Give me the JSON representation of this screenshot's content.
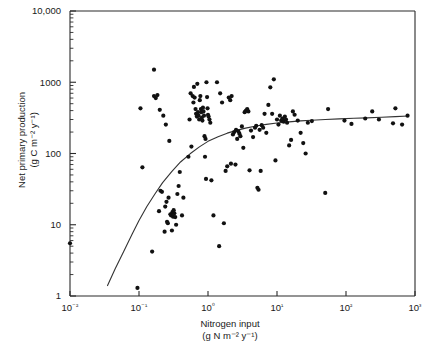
{
  "chart_data": {
    "type": "scatter",
    "title": "",
    "xlabel": "Nitrogen input",
    "xlabel_units": "(g N m⁻² y⁻¹)",
    "ylabel": "Net primary production",
    "ylabel_units": "(g C m⁻² y⁻¹)",
    "xscale": "log",
    "yscale": "log",
    "xlim": [
      0.01,
      1000
    ],
    "ylim": [
      1,
      10000
    ],
    "grid": false,
    "legend": null,
    "x_tick_labels": [
      "10⁻²",
      "10⁻¹",
      "10⁰",
      "10¹",
      "10²",
      "10³"
    ],
    "x_tick_values": [
      0.01,
      0.1,
      1,
      10,
      100,
      1000
    ],
    "y_tick_labels": [
      "1",
      "10",
      "100",
      "1000",
      "10,000"
    ],
    "y_tick_values": [
      1,
      10,
      100,
      1000,
      10000
    ],
    "marker": {
      "shape": "circle",
      "color": "#111111",
      "size_px": 4.2
    },
    "fit_curve": {
      "name": "saturating fit",
      "color": "#333333",
      "width_px": 1.1,
      "points": [
        [
          0.035,
          1.4
        ],
        [
          0.045,
          2.4
        ],
        [
          0.06,
          4.2
        ],
        [
          0.08,
          7.5
        ],
        [
          0.1,
          11.5
        ],
        [
          0.13,
          18
        ],
        [
          0.17,
          27
        ],
        [
          0.22,
          39
        ],
        [
          0.3,
          56
        ],
        [
          0.4,
          76
        ],
        [
          0.55,
          99
        ],
        [
          0.75,
          124
        ],
        [
          1.0,
          148
        ],
        [
          1.4,
          172
        ],
        [
          1.9,
          193
        ],
        [
          2.6,
          211
        ],
        [
          3.5,
          227
        ],
        [
          5.0,
          243
        ],
        [
          7.0,
          256
        ],
        [
          10,
          268
        ],
        [
          15,
          278
        ],
        [
          22,
          287
        ],
        [
          32,
          293
        ],
        [
          50,
          300
        ],
        [
          80,
          306
        ],
        [
          130,
          312
        ],
        [
          200,
          316
        ],
        [
          330,
          322
        ],
        [
          520,
          329
        ],
        [
          800,
          336
        ]
      ]
    },
    "points": [
      [
        0.01,
        5.5
      ],
      [
        0.095,
        1.3
      ],
      [
        0.105,
        430
      ],
      [
        0.112,
        64
      ],
      [
        0.155,
        4.2
      ],
      [
        0.165,
        640
      ],
      [
        0.165,
        1500
      ],
      [
        0.175,
        600
      ],
      [
        0.185,
        660
      ],
      [
        0.195,
        15.5
      ],
      [
        0.2,
        410
      ],
      [
        0.205,
        30
      ],
      [
        0.215,
        29
      ],
      [
        0.225,
        340
      ],
      [
        0.235,
        8.0
      ],
      [
        0.24,
        18
      ],
      [
        0.245,
        255
      ],
      [
        0.25,
        21
      ],
      [
        0.255,
        11
      ],
      [
        0.262,
        10.5
      ],
      [
        0.268,
        24
      ],
      [
        0.275,
        150
      ],
      [
        0.285,
        14
      ],
      [
        0.292,
        13.5
      ],
      [
        0.3,
        8.3
      ],
      [
        0.305,
        15
      ],
      [
        0.312,
        13
      ],
      [
        0.318,
        16
      ],
      [
        0.325,
        14.5
      ],
      [
        0.335,
        12.8
      ],
      [
        0.345,
        10
      ],
      [
        0.36,
        27
      ],
      [
        0.375,
        35
      ],
      [
        0.39,
        55
      ],
      [
        0.42,
        13.5
      ],
      [
        0.44,
        24
      ],
      [
        0.52,
        90
      ],
      [
        0.54,
        300
      ],
      [
        0.56,
        700
      ],
      [
        0.575,
        125
      ],
      [
        0.6,
        640
      ],
      [
        0.615,
        520
      ],
      [
        0.625,
        860
      ],
      [
        0.64,
        610
      ],
      [
        0.66,
        420
      ],
      [
        0.672,
        360
      ],
      [
        0.69,
        330
      ],
      [
        0.7,
        950
      ],
      [
        0.715,
        380
      ],
      [
        0.73,
        340
      ],
      [
        0.745,
        300
      ],
      [
        0.76,
        560
      ],
      [
        0.775,
        640
      ],
      [
        0.79,
        420
      ],
      [
        0.8,
        380
      ],
      [
        0.815,
        320
      ],
      [
        0.83,
        290
      ],
      [
        0.845,
        440
      ],
      [
        0.86,
        390
      ],
      [
        0.875,
        340
      ],
      [
        0.89,
        175
      ],
      [
        0.905,
        90
      ],
      [
        0.92,
        160
      ],
      [
        0.935,
        44
      ],
      [
        0.95,
        1000
      ],
      [
        0.97,
        620
      ],
      [
        0.985,
        430
      ],
      [
        1.0,
        350
      ],
      [
        1.02,
        330
      ],
      [
        1.05,
        300
      ],
      [
        1.08,
        270
      ],
      [
        1.12,
        42
      ],
      [
        1.2,
        13.5
      ],
      [
        1.35,
        1000
      ],
      [
        1.45,
        5.0
      ],
      [
        1.5,
        700
      ],
      [
        1.6,
        520
      ],
      [
        1.7,
        10.5
      ],
      [
        1.8,
        57
      ],
      [
        1.9,
        66
      ],
      [
        2.0,
        610
      ],
      [
        2.1,
        560
      ],
      [
        2.15,
        72
      ],
      [
        2.2,
        640
      ],
      [
        2.3,
        185
      ],
      [
        2.4,
        200
      ],
      [
        2.5,
        70
      ],
      [
        2.55,
        215
      ],
      [
        2.65,
        160
      ],
      [
        2.75,
        205
      ],
      [
        2.85,
        190
      ],
      [
        2.95,
        175
      ],
      [
        3.1,
        240
      ],
      [
        3.25,
        120
      ],
      [
        3.4,
        380
      ],
      [
        3.55,
        400
      ],
      [
        3.7,
        420
      ],
      [
        3.85,
        390
      ],
      [
        4.0,
        58
      ],
      [
        4.2,
        210
      ],
      [
        4.5,
        170
      ],
      [
        4.8,
        230
      ],
      [
        5.0,
        245
      ],
      [
        5.2,
        33
      ],
      [
        5.4,
        31
      ],
      [
        5.6,
        215
      ],
      [
        5.8,
        57
      ],
      [
        6.0,
        250
      ],
      [
        6.3,
        230
      ],
      [
        6.6,
        360
      ],
      [
        7.0,
        195
      ],
      [
        7.5,
        480
      ],
      [
        8.0,
        850
      ],
      [
        8.5,
        360
      ],
      [
        9.0,
        1100
      ],
      [
        9.5,
        80
      ],
      [
        10.0,
        300
      ],
      [
        10.5,
        255
      ],
      [
        11.0,
        340
      ],
      [
        11.5,
        290
      ],
      [
        12.0,
        310
      ],
      [
        12.5,
        280
      ],
      [
        13.0,
        330
      ],
      [
        13.5,
        300
      ],
      [
        14.0,
        270
      ],
      [
        15.0,
        130
      ],
      [
        16.0,
        155
      ],
      [
        17.0,
        390
      ],
      [
        18.0,
        350
      ],
      [
        20.0,
        290
      ],
      [
        22.0,
        195
      ],
      [
        24.0,
        140
      ],
      [
        26.0,
        100
      ],
      [
        28.0,
        270
      ],
      [
        32.0,
        285
      ],
      [
        50.0,
        28
      ],
      [
        55.0,
        420
      ],
      [
        95.0,
        290
      ],
      [
        120.0,
        260
      ],
      [
        190.0,
        310
      ],
      [
        240.0,
        390
      ],
      [
        300.0,
        300
      ],
      [
        480.0,
        265
      ],
      [
        520.0,
        430
      ],
      [
        650.0,
        255
      ],
      [
        780.0,
        340
      ]
    ]
  }
}
